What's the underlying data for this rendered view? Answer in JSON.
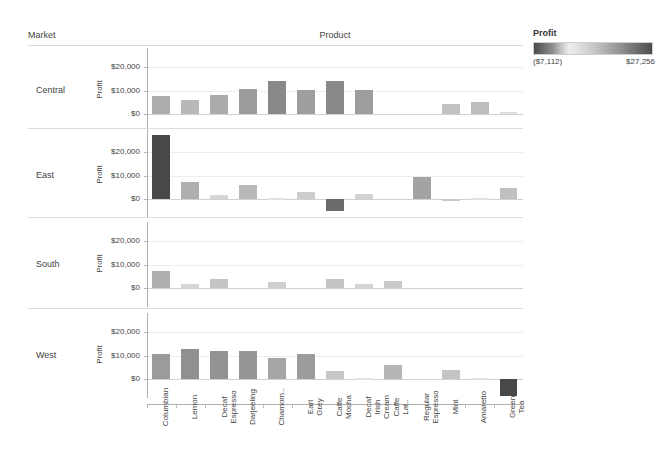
{
  "headers": {
    "market": "Market",
    "product": "Product"
  },
  "legend": {
    "title": "Profit",
    "min_label": "($7,112)",
    "max_label": "$27,256",
    "min_value": -7112,
    "max_value": 27256
  },
  "axis": {
    "y_title": "Profit",
    "ticks": [
      "$20,000",
      "$10,000",
      "$0"
    ],
    "tick_values": [
      20000,
      10000,
      0
    ]
  },
  "chart_data": {
    "type": "bar",
    "xlabel": "Product",
    "ylabel": "Profit",
    "ylim": [
      -8000,
      28000
    ],
    "grid": true,
    "legend_position": "top-right",
    "color_scale": {
      "field": "Profit",
      "min": -7112,
      "max": 27256,
      "min_label": "($7,112)",
      "max_label": "$27,256"
    },
    "categories": [
      "Columbian",
      "Lemon",
      "Decaf Espresso",
      "Darjeeling",
      "Chamom..",
      "Earl Grey",
      "Caffe Mocha",
      "Decaf Irish Cream",
      "Caffe Lat..",
      "Regular Espresso",
      "Mint",
      "Amaretto",
      "Green Tea"
    ],
    "panels": [
      {
        "name": "Central",
        "values": [
          7600,
          5800,
          8000,
          10500,
          13900,
          10200,
          14000,
          10300,
          null,
          null,
          4300,
          5100,
          700
        ]
      },
      {
        "name": "East",
        "values": [
          27256,
          7200,
          1700,
          5800,
          400,
          2900,
          -5200,
          2100,
          null,
          9300,
          -900,
          300,
          4600
        ]
      },
      {
        "name": "South",
        "values": [
          7300,
          1700,
          3900,
          null,
          2500,
          null,
          4000,
          1900,
          3100,
          null,
          null,
          null,
          null
        ]
      },
      {
        "name": "West",
        "values": [
          10700,
          12700,
          12100,
          11700,
          8800,
          10500,
          3600,
          300,
          6100,
          null,
          4000,
          400,
          -7112
        ]
      }
    ]
  }
}
